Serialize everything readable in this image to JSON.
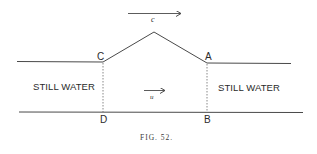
{
  "figure": {
    "caption": "FIG. 52.",
    "regions": {
      "left_label": "STILL WATER",
      "right_label": "STILL WATER"
    },
    "points": {
      "C": "C",
      "A": "A",
      "D": "D",
      "B": "B"
    },
    "arrows": {
      "wave_velocity_label": "c",
      "flow_velocity_label": "u"
    },
    "colors": {
      "line": "#4a4a4a",
      "background": "#ffffff"
    }
  }
}
